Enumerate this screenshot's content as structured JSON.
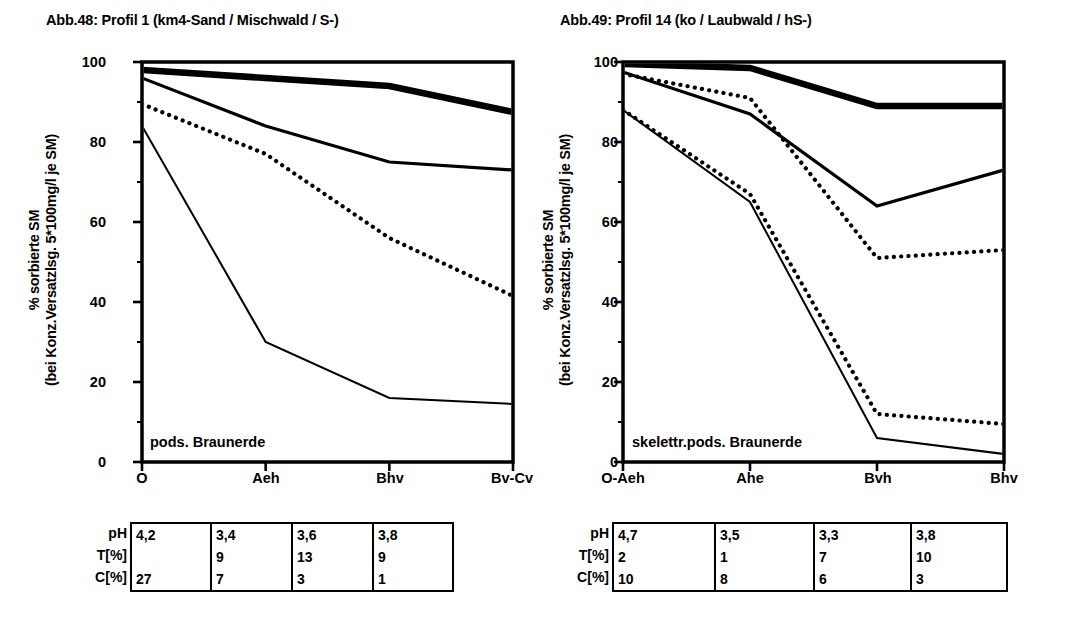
{
  "panels": [
    {
      "title": "Abb.48: Profil 1 (km4-Sand / Mischwald / S-)",
      "ylabel_line1": "% sorbierte SM",
      "ylabel_line2": "(bei Konz.Versatzlsg. 5*100mg/l je SM)",
      "soil_note": "pods. Braunerde",
      "table": {
        "row_labels": [
          "pH",
          "T[%]",
          "C[%]"
        ],
        "rows": [
          [
            "4,2",
            "3,4",
            "3,6",
            "3,8"
          ],
          [
            "",
            "9",
            "13",
            "9"
          ],
          [
            "27",
            "7",
            "3",
            "1"
          ]
        ]
      },
      "chart_data": {
        "type": "line",
        "title": "Abb.48: Profil 1 (km4-Sand / Mischwald / S-)",
        "xlabel": "",
        "ylabel": "% sorbierte SM (bei Konz.Versatzlsg. 5*100mg/l je SM)",
        "categories": [
          "O",
          "Aeh",
          "Bhv",
          "Bv-Cv"
        ],
        "ylim": [
          0,
          100
        ],
        "yticks": [
          0,
          20,
          40,
          60,
          80,
          100
        ],
        "grid": false,
        "legend": "none",
        "annotation": "pods. Braunerde",
        "series": [
          {
            "name": "thick-solid",
            "style": "thick-solid",
            "values": [
              98,
              96,
              94,
              87.5
            ]
          },
          {
            "name": "medium-hatched",
            "style": "medium-hatched",
            "values": [
              96,
              84,
              75,
              73
            ]
          },
          {
            "name": "dotted",
            "style": "dotted",
            "values": [
              89.5,
              77,
              56,
              41.5
            ]
          },
          {
            "name": "thin-solid",
            "style": "thin-solid",
            "values": [
              84,
              30,
              16,
              14.5
            ]
          }
        ]
      }
    },
    {
      "title": "Abb.49: Profil 14 (ko / Laubwald / hS-)",
      "ylabel_line1": "% sorbierte SM",
      "ylabel_line2": "(bei Konz.Versatzlsg. 5*100mg/l je SM)",
      "soil_note": "skelettr.pods. Braunerde",
      "table": {
        "row_labels": [
          "pH",
          "T[%]",
          "C[%]"
        ],
        "rows": [
          [
            "4,7",
            "3,5",
            "3,3",
            "3,8"
          ],
          [
            "2",
            "1",
            "7",
            "10"
          ],
          [
            "10",
            "8",
            "6",
            "3"
          ]
        ]
      },
      "chart_data": {
        "type": "line",
        "title": "Abb.49: Profil 14 (ko / Laubwald / hS-)",
        "xlabel": "",
        "ylabel": "% sorbierte SM (bei Konz.Versatzlsg. 5*100mg/l je SM)",
        "categories": [
          "O-Aeh",
          "Ahe",
          "Bvh",
          "Bhv"
        ],
        "ylim": [
          0,
          100
        ],
        "yticks": [
          0,
          20,
          40,
          60,
          80,
          100
        ],
        "grid": false,
        "legend": "none",
        "annotation": "skelettr.pods. Braunerde",
        "series": [
          {
            "name": "thick-solid",
            "style": "thick-solid",
            "values": [
              99.5,
              98.5,
              89,
              89
            ]
          },
          {
            "name": "medium-hatched",
            "style": "medium-hatched",
            "values": [
              97.5,
              87,
              64,
              73
            ]
          },
          {
            "name": "dotted",
            "style": "dotted",
            "values": [
              97,
              91,
              51,
              53
            ]
          },
          {
            "name": "thin-solid",
            "style": "thin-solid",
            "values": [
              88,
              65,
              6,
              2
            ]
          },
          {
            "name": "dotted-low",
            "style": "dotted",
            "values": [
              88,
              67,
              12,
              9.5
            ]
          }
        ]
      }
    }
  ]
}
